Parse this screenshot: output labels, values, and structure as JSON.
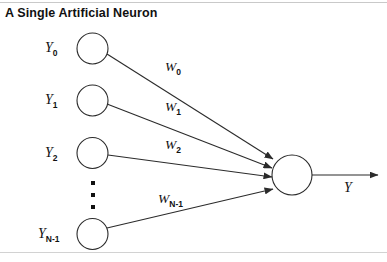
{
  "title": "A Single Artificial Neuron",
  "diagram": {
    "type": "neural-network-single-neuron",
    "inputs": [
      {
        "label_base": "Y",
        "label_sub": "0",
        "cx": 92.5,
        "cy": 48.5,
        "r": 15.5
      },
      {
        "label_base": "Y",
        "label_sub": "1",
        "cx": 92.5,
        "cy": 100.5,
        "r": 15.5
      },
      {
        "label_base": "Y",
        "label_sub": "2",
        "cx": 92.5,
        "cy": 153.0,
        "r": 15.5
      },
      {
        "label_base": "Y",
        "label_sub": "N-1",
        "cx": 92.5,
        "cy": 234.0,
        "r": 15.5
      }
    ],
    "weights": [
      {
        "label_base": "W",
        "label_sub": "0",
        "x": 165,
        "y": 59
      },
      {
        "label_base": "W",
        "label_sub": "1",
        "x": 165,
        "y": 99
      },
      {
        "label_base": "W",
        "label_sub": "2",
        "x": 165,
        "y": 137
      },
      {
        "label_base": "W",
        "label_sub": "N-1",
        "x": 158,
        "y": 191
      }
    ],
    "ellipsis": {
      "x": 91,
      "y_positions": [
        181,
        193,
        205
      ],
      "count": 3
    },
    "output_node": {
      "cx": 292,
      "cy": 175,
      "r": 20
    },
    "output_label": {
      "text": "Y",
      "x": 344,
      "y": 180
    },
    "output_arrow": {
      "x1": 312,
      "y1": 175,
      "x2": 378,
      "y2": 175
    },
    "stroke_color": "#2b2b2b",
    "fill_color": "#ffffff"
  }
}
